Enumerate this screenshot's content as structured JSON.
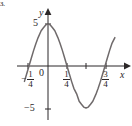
{
  "figure": {
    "problem_number": "3.",
    "background_color": "#ffffff",
    "curve_color": "#6f6a6b",
    "axis_color": "#2b2728"
  },
  "axes": {
    "x_name": "x",
    "y_name": "y",
    "origin_label": "0",
    "y_tick_positive": "5",
    "y_tick_negative": "−5",
    "x_tick_labels": [
      {
        "name": "neg-one-quarter",
        "lead": "−",
        "numerator": "1",
        "denominator": "4",
        "x_value": -0.25
      },
      {
        "name": "one-quarter",
        "lead": "",
        "numerator": "1",
        "denominator": "4",
        "x_value": 0.25
      },
      {
        "name": "three-quarters",
        "lead": "",
        "numerator": "3",
        "denominator": "4",
        "x_value": 0.75
      }
    ],
    "unlabeled_tick_x_value": 0.5
  },
  "chart_data": {
    "type": "line",
    "title": "",
    "xlabel": "x",
    "ylabel": "y",
    "xlim": [
      -0.35,
      0.95
    ],
    "ylim": [
      -7,
      7
    ],
    "grid": false,
    "legend": null,
    "equation": "y = 5 cos(2πx)",
    "amplitude": 5,
    "period": 1,
    "x_ticks": [
      -0.25,
      0.25,
      0.5,
      0.75
    ],
    "x_tick_labels": [
      "-1/4",
      "1/4",
      "",
      "3/4"
    ],
    "y_ticks": [
      -5,
      5
    ],
    "y_tick_labels": [
      "-5",
      "5"
    ],
    "key_points": [
      {
        "label": "x-intercept",
        "x": -0.25,
        "y": 0
      },
      {
        "label": "maximum",
        "x": 0,
        "y": 5
      },
      {
        "label": "x-intercept",
        "x": 0.25,
        "y": 0
      },
      {
        "label": "minimum",
        "x": 0.5,
        "y": -5
      },
      {
        "label": "x-intercept",
        "x": 0.75,
        "y": 0
      }
    ],
    "x": [
      -0.31,
      -0.28,
      -0.25,
      -0.22,
      -0.19,
      -0.16,
      -0.13,
      -0.09,
      -0.06,
      -0.03,
      0.0,
      0.03,
      0.06,
      0.09,
      0.13,
      0.16,
      0.19,
      0.22,
      0.25,
      0.28,
      0.31,
      0.34,
      0.38,
      0.41,
      0.44,
      0.47,
      0.5,
      0.53,
      0.56,
      0.59,
      0.63,
      0.66,
      0.69,
      0.72,
      0.75,
      0.78,
      0.81,
      0.84,
      0.88
    ],
    "y": [
      -1.83,
      -0.93,
      0.0,
      0.93,
      1.83,
      2.66,
      3.38,
      4.2,
      4.56,
      4.89,
      5.0,
      4.89,
      4.56,
      4.2,
      3.38,
      2.66,
      1.83,
      0.93,
      0.0,
      -0.93,
      -1.83,
      -2.66,
      -3.38,
      -4.2,
      -4.56,
      -4.89,
      -5.0,
      -4.89,
      -4.56,
      -4.2,
      -3.38,
      -2.66,
      -1.83,
      -0.93,
      0.0,
      0.93,
      1.83,
      2.66,
      3.38
    ]
  }
}
